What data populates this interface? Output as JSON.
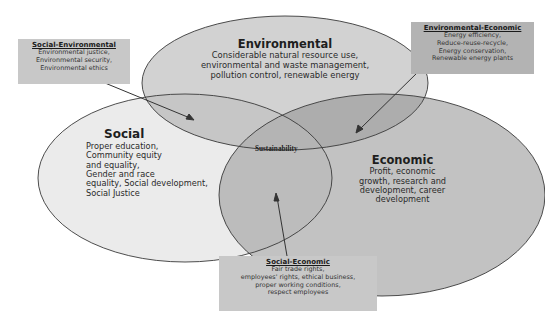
{
  "colors": {
    "background": "#ffffff",
    "social_fill": "#ebebeb",
    "environmental_fill": "#cfcfcf",
    "economic_fill": "#bdbdbd",
    "callout_fill": "#c8c8c8",
    "outline": "#333333"
  },
  "circles": {
    "environmental": {
      "title": "Environmental",
      "lines": [
        "Considerable natural resource use,",
        "environmental and waste management,",
        "pollution control, renewable energy"
      ]
    },
    "social": {
      "title": "Social",
      "lines": [
        "Proper education,",
        "Community equity",
        "and equality,",
        "Gender and race",
        "equality, Social development,",
        "Social Justice"
      ]
    },
    "economic": {
      "title": "Economic",
      "lines": [
        "Profit, economic",
        "growth, research and",
        "development, career",
        "development"
      ]
    }
  },
  "center": {
    "label": "Sustainability"
  },
  "callouts": {
    "social_environmental": {
      "title": "Social-Environmental",
      "lines": [
        "Environmental justice,",
        "Environmental security,",
        "Environmental ethics"
      ]
    },
    "environmental_economic": {
      "title": "Environmental-Economic",
      "lines": [
        "Energy efficiency,",
        "Reduce-reuse-recycle,",
        "Energy conservation,",
        "Renewable energy plants"
      ]
    },
    "social_economic": {
      "title": "Social-Economic",
      "lines": [
        "Fair trade rights,",
        "employees' rights, ethical business,",
        "proper working conditions,",
        "respect employees"
      ]
    }
  }
}
